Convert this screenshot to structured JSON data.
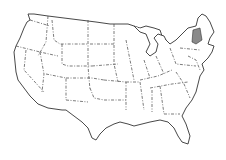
{
  "map": {
    "type": "outline map",
    "region": "United States (contiguous)",
    "style": "black outline, dashed state borders, white fill",
    "highlighted_region": {
      "description": "New England states shaded gray (Vermont / New Hampshire area)",
      "color": "#8a8a8a"
    },
    "background_color": "#ffffff"
  }
}
